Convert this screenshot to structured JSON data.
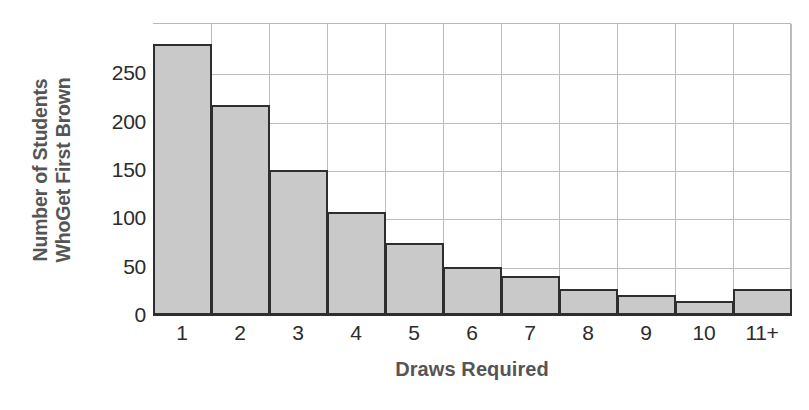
{
  "chart_data": {
    "type": "bar",
    "title": "",
    "subtitle": "",
    "xlabel": "Draws Required",
    "ylabel": "Number of Students WhoGet First Brown",
    "ylabel_lines": [
      "Number of Students",
      "WhoGet First Brown"
    ],
    "categories": [
      "1",
      "2",
      "3",
      "4",
      "5",
      "6",
      "7",
      "8",
      "9",
      "10",
      "11+"
    ],
    "values": [
      280,
      217,
      150,
      107,
      74,
      50,
      40,
      27,
      21,
      15,
      27
    ],
    "ytick_labels": [
      "0",
      "50",
      "100",
      "150",
      "200",
      "250"
    ],
    "ytick_values": [
      0,
      50,
      100,
      150,
      200,
      250
    ],
    "ylim": [
      0,
      302
    ],
    "xlim": [
      0,
      11
    ],
    "grid": "both",
    "legend": "none",
    "bar_fill_color": "#c9c9c9",
    "bar_edge_color": "#2e2e2e",
    "grid_color": "#bdbdbd",
    "axis_color": "#2e2e2e",
    "tick_label_color": "#2b2b2b",
    "axis_title_color": "#555555",
    "background_color": "#ffffff"
  }
}
